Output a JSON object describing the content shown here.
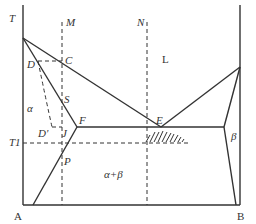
{
  "diagram": {
    "type": "binary eutectic phase diagram",
    "components": {
      "left": "A",
      "right": "B"
    },
    "axis_labels": {
      "temperature": "T",
      "isotherm": "T1"
    },
    "regions": {
      "liquid": "L",
      "alpha": "α",
      "beta": "β",
      "alpha_beta": "α+β"
    },
    "points": {
      "C": "C",
      "D": "D",
      "S": "S",
      "F": "F",
      "E": "E",
      "J": "J",
      "D_prime": "D'",
      "P": "P"
    },
    "composition_lines": {
      "M": "M",
      "N": "N"
    },
    "colors": {
      "line": "#333333",
      "background": "#ffffff"
    }
  }
}
